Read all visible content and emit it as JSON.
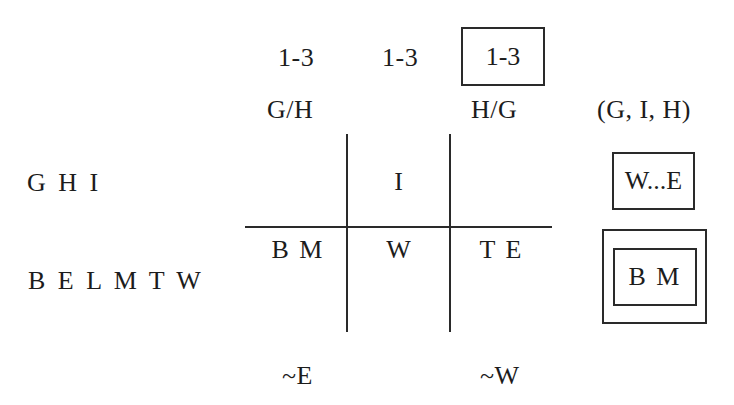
{
  "column_headers": {
    "ranges": [
      "1-3",
      "1-3",
      "1-3"
    ],
    "boxed_range_index": 2,
    "labels": [
      "G/H",
      "",
      "H/G"
    ],
    "summary_label": "(G, I, H)"
  },
  "row_labels": [
    "G H I",
    "B E L M T W"
  ],
  "grid": {
    "top_row": [
      "",
      "I",
      ""
    ],
    "bottom_row": [
      "B M",
      "W",
      "T E"
    ]
  },
  "right_column": {
    "top_box": "W...E",
    "bottom_double_box": "B M"
  },
  "footer_labels": [
    "~E",
    "",
    "~W"
  ],
  "colors": {
    "ink": "#1c1c1c",
    "lines": "#2a2a2a",
    "background": "#ffffff"
  }
}
